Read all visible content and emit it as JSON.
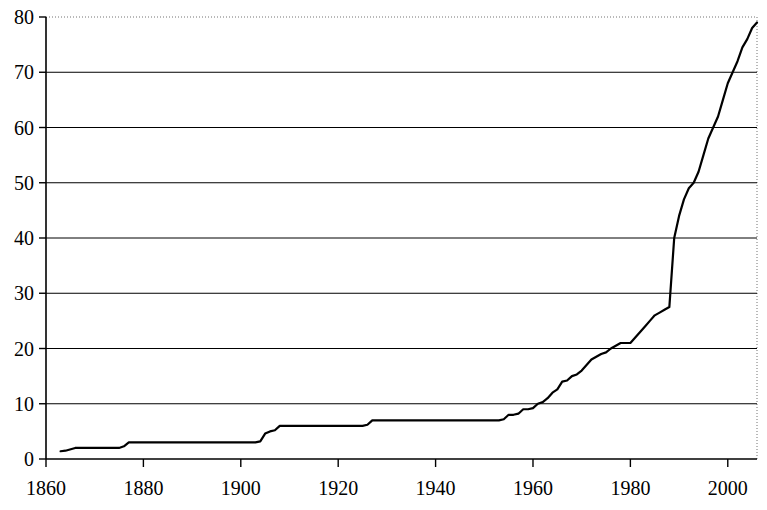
{
  "chart_data": {
    "type": "line",
    "title": "",
    "subtitle": "",
    "xlabel": "",
    "ylabel": "",
    "xlim": [
      1860,
      2006
    ],
    "ylim": [
      0,
      80
    ],
    "xticks": [
      1860,
      1880,
      1900,
      1920,
      1940,
      1960,
      1980,
      2000
    ],
    "xtick_labels": [
      "1860",
      "1880",
      "1900",
      "1920",
      "1940",
      "1960",
      "1980",
      "2000"
    ],
    "yticks": [
      0,
      10,
      20,
      30,
      40,
      50,
      60,
      70,
      80
    ],
    "ytick_labels": [
      "0",
      "10",
      "20",
      "30",
      "40",
      "50",
      "60",
      "70",
      "80"
    ],
    "grid": "horizontal",
    "grid_color": "#000000",
    "line_color": "#000000",
    "line_width": 2.2,
    "legend": null,
    "annotations": [],
    "series": [
      {
        "name": "cumulative count",
        "x": [
          1863,
          1864,
          1866,
          1868,
          1874,
          1875,
          1876,
          1877,
          1880,
          1885,
          1890,
          1895,
          1900,
          1903,
          1904,
          1905,
          1906,
          1907,
          1908,
          1909,
          1910,
          1915,
          1920,
          1925,
          1926,
          1927,
          1928,
          1930,
          1935,
          1940,
          1945,
          1950,
          1953,
          1954,
          1955,
          1956,
          1957,
          1958,
          1959,
          1960,
          1961,
          1962,
          1963,
          1964,
          1965,
          1966,
          1967,
          1968,
          1969,
          1970,
          1971,
          1972,
          1973,
          1974,
          1975,
          1976,
          1977,
          1978,
          1979,
          1980,
          1981,
          1982,
          1983,
          1984,
          1985,
          1986,
          1987,
          1988,
          1989,
          1990,
          1991,
          1992,
          1993,
          1994,
          1995,
          1996,
          1997,
          1998,
          1999,
          2000,
          2001,
          2002,
          2003,
          2004,
          2005,
          2006
        ],
        "y": [
          1.4,
          1.5,
          2.0,
          2.0,
          2.0,
          2.0,
          2.3,
          3.0,
          3.0,
          3.0,
          3.0,
          3.0,
          3.0,
          3.0,
          3.2,
          4.6,
          5.0,
          5.2,
          6.0,
          6.0,
          6.0,
          6.0,
          6.0,
          6.0,
          6.2,
          7.0,
          7.0,
          7.0,
          7.0,
          7.0,
          7.0,
          7.0,
          7.0,
          7.2,
          8.0,
          8.0,
          8.2,
          9.0,
          9.0,
          9.2,
          10.0,
          10.3,
          11.0,
          12.0,
          12.6,
          14.0,
          14.2,
          15.0,
          15.3,
          16.0,
          17.0,
          18.0,
          18.5,
          19.0,
          19.3,
          20.0,
          20.5,
          21.0,
          21.0,
          21.0,
          22.0,
          23.0,
          24.0,
          25.0,
          26.0,
          26.5,
          27.0,
          27.5,
          40.0,
          44.0,
          47.0,
          49.0,
          50.0,
          52.0,
          55.0,
          58.0,
          60.0,
          62.0,
          65.0,
          68.0,
          70.0,
          72.0,
          74.5,
          76.0,
          78.0,
          79.0
        ]
      }
    ]
  },
  "axis": {
    "x_tick_positions_px": [
      46,
      144,
      242,
      340,
      438,
      535,
      633,
      731
    ],
    "y_tick_positions_px": [
      459,
      404,
      348,
      293,
      238,
      182,
      127,
      72,
      17
    ],
    "plot_left_px": 46,
    "plot_right_px": 757,
    "plot_top_px": 17,
    "plot_bottom_px": 459
  }
}
